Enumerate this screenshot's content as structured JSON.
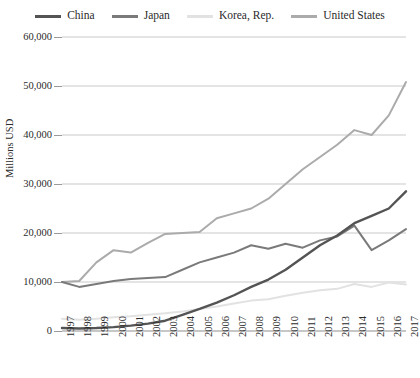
{
  "chart_data": {
    "type": "line",
    "title": "",
    "xlabel": "",
    "ylabel": "Millions USD",
    "x": [
      1997,
      1998,
      1999,
      2000,
      2001,
      2002,
      2003,
      2004,
      2005,
      2006,
      2007,
      2008,
      2009,
      2010,
      2011,
      2012,
      2013,
      2014,
      2015,
      2016,
      2017
    ],
    "xlim": [
      1997,
      2017
    ],
    "ylim": [
      0,
      60000
    ],
    "yticks": [
      0,
      10000,
      20000,
      30000,
      40000,
      50000,
      60000
    ],
    "ytick_labels": [
      "0",
      "10,000",
      "20,000",
      "30,000",
      "40,000",
      "50,000",
      "60,000"
    ],
    "xtick_labels": [
      "1997",
      "1998",
      "1999",
      "2000",
      "2001",
      "2002",
      "2003",
      "2004",
      "2005",
      "2006",
      "2007",
      "2008",
      "2009",
      "2010",
      "2011",
      "2012",
      "2013",
      "2014",
      "2015",
      "2016",
      "2017"
    ],
    "grid": "horizontal",
    "legend_position": "top",
    "series": [
      {
        "name": "China",
        "color": "#545454",
        "values": [
          600,
          500,
          600,
          800,
          1100,
          1500,
          2100,
          3300,
          4500,
          5800,
          7300,
          9000,
          10500,
          12500,
          15000,
          17500,
          19500,
          22000,
          23500,
          25000,
          28500
        ]
      },
      {
        "name": "Japan",
        "color": "#7a7a7a",
        "values": [
          10000,
          9000,
          9600,
          10200,
          10600,
          10800,
          11000,
          12500,
          14000,
          15000,
          16000,
          17500,
          16800,
          17800,
          17000,
          18500,
          19300,
          21500,
          16500,
          18500,
          20800
        ]
      },
      {
        "name": "Korea, Rep.",
        "color": "#e2e2e2",
        "values": [
          2500,
          2300,
          2500,
          2800,
          3000,
          3300,
          3600,
          4000,
          4500,
          5000,
          5600,
          6200,
          6500,
          7200,
          7800,
          8300,
          8600,
          9600,
          9000,
          9900,
          9500
        ]
      },
      {
        "name": "United States",
        "color": "#ababab",
        "values": [
          10000,
          10200,
          14000,
          16500,
          16000,
          18000,
          19800,
          20000,
          20200,
          23000,
          24000,
          25000,
          27000,
          30000,
          33000,
          35500,
          38000,
          41000,
          40000,
          44000,
          50800
        ]
      }
    ]
  },
  "legend": {
    "items": [
      {
        "label": "China"
      },
      {
        "label": "Japan"
      },
      {
        "label": "Korea, Rep."
      },
      {
        "label": "United States"
      }
    ]
  },
  "axes": {
    "y_axis_title": "Millions USD"
  }
}
